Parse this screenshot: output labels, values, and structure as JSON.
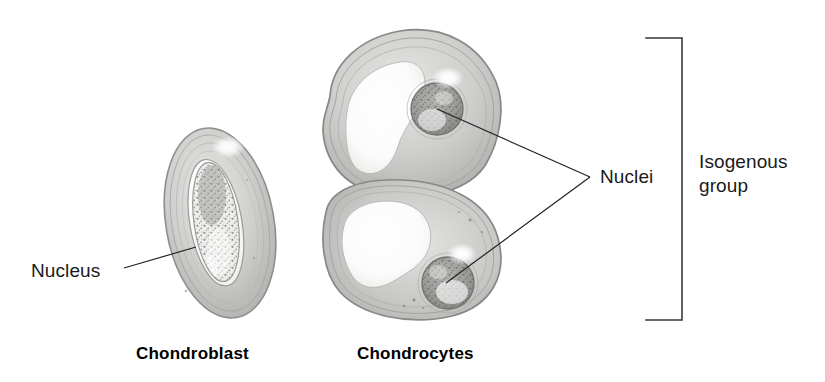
{
  "figure": {
    "background_color": "#ffffff",
    "width": 825,
    "height": 382
  },
  "labels": {
    "nucleus": "Nucleus",
    "nuclei": "Nuclei",
    "isogenous_line1": "Isogenous",
    "isogenous_line2": "group"
  },
  "captions": {
    "chondroblast": "Chondroblast",
    "chondrocytes": "Chondrocytes"
  },
  "colors": {
    "text": "#1a1a1a",
    "caption_text": "#000000",
    "leader_line": "#222222",
    "bracket": "#3a3a3a",
    "cell_outline": "#8e8e8e",
    "cell_fill_light": "#d8d8d6",
    "cell_fill_mid": "#c2c2c0",
    "cell_fill_dark": "#a8a8a6",
    "lacuna_white": "#fdfdfd",
    "nucleus_gray": "#9a9a98",
    "nucleus_speckle": "#5f5f5d",
    "highlight": "#ffffff"
  },
  "leader_lines": [
    {
      "name": "nucleus-leader",
      "from": [
        124,
        268
      ],
      "to": [
        196,
        247
      ]
    },
    {
      "name": "nuclei-upper-leader",
      "from": [
        590,
        177
      ],
      "to": [
        437,
        109
      ]
    },
    {
      "name": "nuclei-lower-leader",
      "from": [
        590,
        177
      ],
      "to": [
        446,
        283
      ]
    }
  ],
  "bracket": {
    "name": "isogenous-group-bracket",
    "spine_x": 682,
    "arm_x": 646,
    "top_y": 38,
    "bottom_y": 320
  },
  "cells": [
    {
      "name": "chondroblast-cell",
      "type": "chondroblast",
      "center": [
        220,
        223
      ],
      "width": 104,
      "height": 190,
      "rotation_deg": -10,
      "nucleus": {
        "center": [
          216,
          222
        ],
        "width": 44,
        "height": 120,
        "rotation_deg": -8
      }
    },
    {
      "name": "chondrocyte-upper-cell",
      "type": "chondrocyte",
      "center": [
        405,
        115
      ],
      "nucleus": {
        "center": [
          437,
          109
        ],
        "radius": 26
      }
    },
    {
      "name": "chondrocyte-lower-cell",
      "type": "chondrocyte",
      "center": [
        405,
        238
      ],
      "nucleus": {
        "center": [
          448,
          283
        ],
        "radius": 26
      }
    }
  ]
}
